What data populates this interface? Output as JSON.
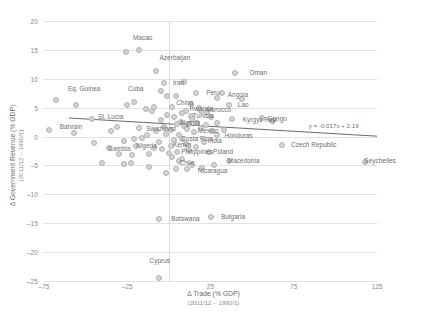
{
  "chart_data": {
    "type": "scatter",
    "title": "",
    "xlabel": "Δ Trade (% GDP)",
    "xlabel_sub": "(2011/12 – 1990/1)",
    "ylabel": "Δ Government Revenue (% GDP)",
    "ylabel_sub": "(2011/12 – 1990/1)",
    "xlim": [
      -75,
      125
    ],
    "ylim": [
      -25,
      20
    ],
    "xticks": [
      -75,
      -25,
      25,
      75,
      125
    ],
    "yticks": [
      20,
      15,
      10,
      5,
      0,
      -5,
      -10,
      -15,
      -20,
      -25
    ],
    "grid": "horizontal",
    "legend": "none",
    "marker_color": "#d3d3d3",
    "marker_edge_color": "#b4b4b4",
    "trendline": {
      "equation": "y = -0.017x + 2.19",
      "slope": -0.017,
      "intercept": 2.19,
      "color": "#595959"
    },
    "points": [
      {
        "label": "Macao",
        "x": -26,
        "y": 14.6,
        "lx": -24,
        "ly": 17.0
      },
      {
        "label": "",
        "x": -18,
        "y": 15.0
      },
      {
        "label": "Azerbaijan",
        "x": -8,
        "y": 11.3,
        "lx": -8,
        "ly": 13.6
      },
      {
        "label": "Oman",
        "x": 40,
        "y": 11.0,
        "lx": 46,
        "ly": 11.0
      },
      {
        "label": "Eq. Guinea",
        "x": -68,
        "y": 6.4,
        "lx": -63,
        "ly": 8.2
      },
      {
        "label": "",
        "x": -56,
        "y": 5.5
      },
      {
        "label": "Cuba",
        "x": -25,
        "y": 5.4,
        "lx": -27,
        "ly": 8.3
      },
      {
        "label": "",
        "x": -21,
        "y": 6.0
      },
      {
        "label": "Iran",
        "x": -3,
        "y": 9.2,
        "lx": 0,
        "ly": 9.2
      },
      {
        "label": "",
        "x": 9,
        "y": 9.5
      },
      {
        "label": "",
        "x": -5,
        "y": 7.9
      },
      {
        "label": "Peru",
        "x": 16,
        "y": 7.6,
        "lx": 20,
        "ly": 7.5
      },
      {
        "label": "Angola",
        "x": 32,
        "y": 7.6,
        "lx": 33,
        "ly": 7.2
      },
      {
        "label": "",
        "x": -1,
        "y": 7.1
      },
      {
        "label": "",
        "x": 4,
        "y": 7.0
      },
      {
        "label": "",
        "x": 29,
        "y": 6.6
      },
      {
        "label": "",
        "x": 44,
        "y": 6.5
      },
      {
        "label": "China",
        "x": 2,
        "y": 5.2,
        "lx": 2,
        "ly": 5.8
      },
      {
        "label": "Lao",
        "x": 36,
        "y": 5.5,
        "lx": 39,
        "ly": 5.5
      },
      {
        "label": "",
        "x": -10,
        "y": 4.4
      },
      {
        "label": "Rwanda",
        "x": 10,
        "y": 4.5,
        "lx": 10,
        "ly": 4.8
      },
      {
        "label": "Morocco",
        "x": 19,
        "y": 4.4,
        "lx": 20,
        "ly": 4.6
      },
      {
        "label": "Tunisia",
        "x": 13,
        "y": 3.5,
        "lx": 12,
        "ly": 3.6
      },
      {
        "label": "Kyrgyz Rep.",
        "x": 38,
        "y": 3.0,
        "lx": 42,
        "ly": 2.9
      },
      {
        "label": "Congo",
        "x": 56,
        "y": 3.2,
        "lx": 57,
        "ly": 3.0
      },
      {
        "label": "St. Lucia",
        "x": -46,
        "y": 3.1,
        "lx": -45,
        "ly": 3.4
      },
      {
        "label": "Bahrain",
        "x": -72,
        "y": 1.2,
        "lx": -68,
        "ly": 1.7
      },
      {
        "label": "",
        "x": -57,
        "y": 0.7
      },
      {
        "label": "Swaziland",
        "x": -18,
        "y": 1.5,
        "lx": -16,
        "ly": 1.3
      },
      {
        "label": "Algeria",
        "x": 5,
        "y": 2.2,
        "lx": 4,
        "ly": 2.3
      },
      {
        "label": "Mexico",
        "x": 15,
        "y": 0.8,
        "lx": 15,
        "ly": 0.9
      },
      {
        "label": "Costa Rica",
        "x": 8,
        "y": -0.4,
        "lx": 5,
        "ly": -0.4
      },
      {
        "label": "Honduras",
        "x": 29,
        "y": 0.2,
        "lx": 31,
        "ly": 0.1
      },
      {
        "label": "India",
        "x": 21,
        "y": -0.9,
        "lx": 21,
        "ly": -0.8
      },
      {
        "label": "Kenya",
        "x": 1,
        "y": -1.6,
        "lx": 0,
        "ly": -1.5
      },
      {
        "label": "Nigeria",
        "x": -20,
        "y": -1.7,
        "lx": -22,
        "ly": -1.7
      },
      {
        "label": "Gambia",
        "x": -36,
        "y": -2.0,
        "lx": -39,
        "ly": -2.2
      },
      {
        "label": "Philippines",
        "x": 5,
        "y": -2.6,
        "lx": 5,
        "ly": -2.6
      },
      {
        "label": "Poland",
        "x": 24,
        "y": -2.7,
        "lx": 24,
        "ly": -2.7
      },
      {
        "label": "Czech Republic",
        "x": 68,
        "y": -1.4,
        "lx": 71,
        "ly": -1.4
      },
      {
        "label": "",
        "x": 62,
        "y": 2.7
      },
      {
        "label": "Seychelles",
        "x": 118,
        "y": -4.4,
        "lx": 115,
        "ly": -4.3
      },
      {
        "label": "Chile",
        "x": 6,
        "y": -4.3,
        "lx": 4,
        "ly": -4.6
      },
      {
        "label": "Macedonia",
        "x": 36,
        "y": -4.3,
        "lx": 33,
        "ly": -4.3
      },
      {
        "label": "Nicaragua",
        "x": 11,
        "y": -5.7,
        "lx": 15,
        "ly": -5.9
      },
      {
        "label": "Botswana",
        "x": -6,
        "y": -14.2,
        "lx": -1,
        "ly": -14.2
      },
      {
        "label": "Bulgaria",
        "x": 25,
        "y": -14.0,
        "lx": 29,
        "ly": -14.0
      },
      {
        "label": "Cyprus",
        "x": -6,
        "y": -24.5,
        "lx": -14,
        "ly": -21.6
      },
      {
        "label": "",
        "x": -40,
        "y": -4.6
      },
      {
        "label": "",
        "x": -27,
        "y": -4.7
      },
      {
        "label": "",
        "x": -23,
        "y": -4.6
      },
      {
        "label": "",
        "x": -12,
        "y": -5.2
      },
      {
        "label": "",
        "x": -16,
        "y": -0.3
      },
      {
        "label": "",
        "x": -21,
        "y": -0.5
      },
      {
        "label": "",
        "x": -27,
        "y": -0.7
      },
      {
        "label": "",
        "x": -30,
        "y": -3.0
      },
      {
        "label": "",
        "x": -22,
        "y": -3.2
      },
      {
        "label": "",
        "x": -12,
        "y": -3.1
      },
      {
        "label": "",
        "x": -13,
        "y": 0.3
      },
      {
        "label": "",
        "x": -8,
        "y": 1.0
      },
      {
        "label": "",
        "x": -3,
        "y": 1.6
      },
      {
        "label": "",
        "x": -2,
        "y": 0.5
      },
      {
        "label": "",
        "x": 1,
        "y": 1.1
      },
      {
        "label": "",
        "x": 3,
        "y": 3.3
      },
      {
        "label": "",
        "x": 7,
        "y": 2.6
      },
      {
        "label": "",
        "x": 9,
        "y": 1.9
      },
      {
        "label": "",
        "x": 11,
        "y": 1.3
      },
      {
        "label": "",
        "x": 12,
        "y": 2.1
      },
      {
        "label": "",
        "x": 14,
        "y": 3.0
      },
      {
        "label": "",
        "x": 17,
        "y": 2.4
      },
      {
        "label": "",
        "x": 19,
        "y": 1.5
      },
      {
        "label": "",
        "x": 22,
        "y": 2.0
      },
      {
        "label": "",
        "x": 25,
        "y": 3.4
      },
      {
        "label": "",
        "x": 23,
        "y": 4.2
      },
      {
        "label": "",
        "x": 18,
        "y": 5.0
      },
      {
        "label": "",
        "x": 13,
        "y": 5.6
      },
      {
        "label": "",
        "x": 8,
        "y": 4.1
      },
      {
        "label": "",
        "x": 6,
        "y": 0.2
      },
      {
        "label": "",
        "x": 3,
        "y": -0.6
      },
      {
        "label": "",
        "x": 10,
        "y": -1.3
      },
      {
        "label": "",
        "x": 16,
        "y": -1.8
      },
      {
        "label": "",
        "x": 12,
        "y": -2.3
      },
      {
        "label": "",
        "x": 0,
        "y": -2.9
      },
      {
        "label": "",
        "x": -4,
        "y": -2.2
      },
      {
        "label": "",
        "x": -6,
        "y": -1.0
      },
      {
        "label": "",
        "x": -9,
        "y": -1.9
      },
      {
        "label": "",
        "x": 2,
        "y": -3.6
      },
      {
        "label": "",
        "x": 8,
        "y": -3.8
      },
      {
        "label": "",
        "x": 14,
        "y": -4.9
      },
      {
        "label": "",
        "x": 27,
        "y": -5.0
      },
      {
        "label": "",
        "x": 33,
        "y": 1.2
      },
      {
        "label": "",
        "x": 29,
        "y": 2.4
      },
      {
        "label": "",
        "x": 26,
        "y": 0.9
      },
      {
        "label": "",
        "x": -1,
        "y": 3.8
      },
      {
        "label": "",
        "x": -5,
        "y": 2.9
      },
      {
        "label": "",
        "x": -9,
        "y": 5.1
      },
      {
        "label": "",
        "x": -14,
        "y": 4.7
      },
      {
        "label": "",
        "x": -35,
        "y": 0.9
      },
      {
        "label": "",
        "x": -45,
        "y": -1.2
      },
      {
        "label": "",
        "x": -31,
        "y": 1.6
      },
      {
        "label": "",
        "x": 4,
        "y": -5.6
      },
      {
        "label": "",
        "x": -2,
        "y": -6.3
      },
      {
        "label": "",
        "x": 20,
        "y": -5.4
      }
    ]
  }
}
